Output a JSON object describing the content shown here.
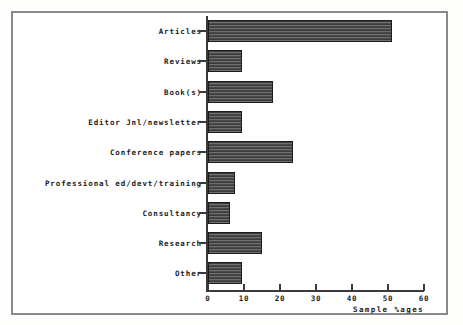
{
  "figure": {
    "frame_color": "#8a8a8a",
    "background": "#ffffff"
  },
  "chart_data": {
    "type": "bar",
    "orientation": "horizontal",
    "title": "",
    "subtitle": "",
    "xlabel": "Sample %ages",
    "ylabel": "",
    "xlim": [
      0,
      60
    ],
    "ylim": [
      0,
      9
    ],
    "grid": false,
    "legend": null,
    "xticks": [
      0,
      10,
      20,
      30,
      40,
      50,
      60
    ],
    "xtick_labels": [
      "0",
      "10",
      "20",
      "30",
      "40",
      "50",
      "60"
    ],
    "categories": [
      "Articles",
      "Reviews",
      "Book(s)",
      "Editor Jnl/newsletter",
      "Conference papers",
      "Professional ed/devt/training",
      "Consultancy",
      "Research",
      "Other"
    ],
    "values": [
      51,
      9.5,
      18,
      9.5,
      23.5,
      7.5,
      6,
      15,
      9.5
    ],
    "bar_color": "#5d5d5d",
    "bar_edge_color": "#1c1c1c",
    "bar_fill_pattern": "horizontal-hatch"
  }
}
